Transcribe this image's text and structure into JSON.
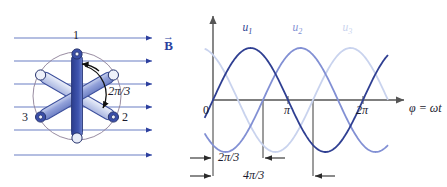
{
  "figure": {
    "type": "three-phase-generator-and-voltage-waveforms",
    "background": "#ffffff"
  },
  "colors": {
    "field_line": "#6b7fc4",
    "field_arrow": "#2c3f9e",
    "coil_dark": "#4257b2",
    "coil_mid": "#8f9fd8",
    "coil_light": "#c3cdeb",
    "coil_outline": "#2b3a78",
    "circle": "#7b6a86",
    "axis": "#555555",
    "text": "#1a1a2e",
    "u1": "#2f3f92",
    "u2": "#8290d4",
    "u3": "#c9d3ee",
    "arc_arrow": "#111111"
  },
  "left_diagram": {
    "name": "rotor-coil-diagram",
    "field_label": "B",
    "field_label_vector": true,
    "field_lines_count": 6,
    "terminal_labels": [
      "1",
      "2",
      "3"
    ],
    "angle_label": "2π/3",
    "coils": [
      {
        "id": "1",
        "angle_deg": 90,
        "shade": "coil_dark"
      },
      {
        "id": "2",
        "angle_deg": 330,
        "shade": "coil_mid"
      },
      {
        "id": "3",
        "angle_deg": 210,
        "shade": "coil_light"
      }
    ]
  },
  "chart_data": {
    "type": "line",
    "title": "",
    "xlabel": "φ = ωt",
    "ylabel": "",
    "xlim": [
      -0.35,
      7.6
    ],
    "ylim": [
      -1.35,
      1.35
    ],
    "grid": false,
    "legend": "inline-curve-labels",
    "x_ticks": [
      {
        "value": 0,
        "label": "0"
      },
      {
        "value": 3.14159265,
        "label": "π"
      },
      {
        "value": 6.28318531,
        "label": "2π"
      }
    ],
    "guide_lines": [
      {
        "value": 2.0943951,
        "label": "2π/3"
      },
      {
        "value": 4.1887902,
        "label": "4π/3"
      }
    ],
    "dimensions": [
      {
        "label": "2π/3",
        "from": 0,
        "to": 2.0943951
      },
      {
        "label": "4π/3",
        "from": 0,
        "to": 4.1887902
      }
    ],
    "series": [
      {
        "name": "u₁",
        "label": "u",
        "subscript": "1",
        "phase_deg": 0,
        "amplitude": 1,
        "color_key": "u1",
        "label_x": 1.5708
      },
      {
        "name": "u₂",
        "label": "u",
        "subscript": "2",
        "phase_deg": -120,
        "amplitude": 1,
        "color_key": "u2",
        "label_x": 3.6652
      },
      {
        "name": "u₃",
        "label": "u",
        "subscript": "3",
        "phase_deg": -240,
        "amplitude": 1,
        "color_key": "u3",
        "label_x": 5.7596
      }
    ]
  }
}
